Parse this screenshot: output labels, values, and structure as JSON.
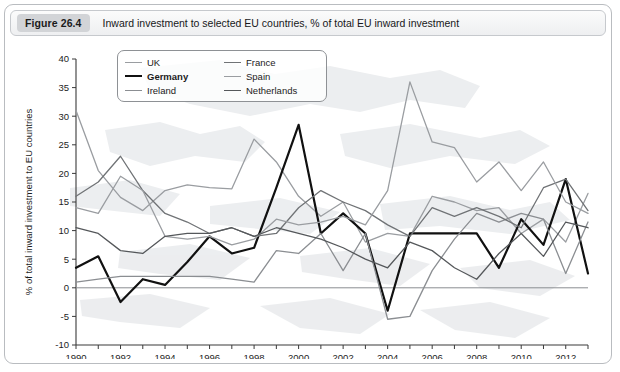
{
  "figure": {
    "badge": "Figure 26.4",
    "caption": "Inward investment to selected EU countries, % of total EU inward investment"
  },
  "chart_data": {
    "type": "line",
    "title": "Inward investment to selected EU countries, % of total EU inward investment",
    "xlabel": "",
    "ylabel": "% of total inward investment to EU countries",
    "xlim": [
      1990,
      2013
    ],
    "ylim": [
      -10,
      40
    ],
    "yticks": [
      -10,
      -5,
      0,
      5,
      10,
      15,
      20,
      25,
      30,
      35,
      40
    ],
    "ytick_labels": [
      "-10",
      "-5",
      "0",
      "5",
      "10",
      "15",
      "20",
      "25",
      "30",
      "35",
      "40"
    ],
    "xticks": [
      1990,
      1992,
      1994,
      1996,
      1998,
      2000,
      2002,
      2004,
      2006,
      2008,
      2010,
      2012
    ],
    "xtick_labels": [
      "1990",
      "1992",
      "1994",
      "1996",
      "1998",
      "2000",
      "2002",
      "2004",
      "2006",
      "2008",
      "2010",
      "2012"
    ],
    "x": [
      1990,
      1991,
      1992,
      1993,
      1994,
      1995,
      1996,
      1997,
      1998,
      1999,
      2000,
      2001,
      2002,
      2003,
      2004,
      2005,
      2006,
      2007,
      2008,
      2009,
      2010,
      2011,
      2012,
      2013
    ],
    "grid": false,
    "zero_line": true,
    "legend_position": "top-center",
    "series": [
      {
        "name": "UK",
        "color": "#9a9da1",
        "width": 1.3,
        "values": [
          31.0,
          20.5,
          15.8,
          13.5,
          17.0,
          18.0,
          17.5,
          17.3,
          26.0,
          22.0,
          16.0,
          12.5,
          15.0,
          8.0,
          9.5,
          9.0,
          16.0,
          15.0,
          13.5,
          14.0,
          9.5,
          12.0,
          8.0,
          16.5
        ]
      },
      {
        "name": "Germany",
        "color": "#111111",
        "width": 2.2,
        "values": [
          3.5,
          5.5,
          -2.5,
          1.5,
          0.5,
          4.5,
          9.0,
          6.0,
          7.0,
          17.5,
          28.5,
          9.5,
          13.0,
          9.5,
          -4.0,
          9.5,
          9.5,
          9.5,
          9.5,
          3.5,
          12.0,
          7.5,
          19.0,
          2.5
        ]
      },
      {
        "name": "Ireland",
        "color": "#8b8e92",
        "width": 1.3,
        "values": [
          1.0,
          1.5,
          2.0,
          2.0,
          2.0,
          2.0,
          2.0,
          1.5,
          1.0,
          6.5,
          6.0,
          9.5,
          3.0,
          9.5,
          -5.5,
          -5.0,
          3.0,
          8.5,
          13.0,
          11.5,
          13.0,
          12.0,
          2.5,
          11.5
        ]
      },
      {
        "name": "France",
        "color": "#707376",
        "width": 1.3,
        "values": [
          16.0,
          18.5,
          23.0,
          17.0,
          13.0,
          11.5,
          9.5,
          10.5,
          9.0,
          9.5,
          14.0,
          17.0,
          15.0,
          13.5,
          11.0,
          9.0,
          14.0,
          12.5,
          14.0,
          12.5,
          10.5,
          17.5,
          19.0,
          13.5
        ]
      },
      {
        "name": "Spain",
        "color": "#9a9da1",
        "width": 1.3,
        "values": [
          14.0,
          13.0,
          19.5,
          17.0,
          9.0,
          8.5,
          9.0,
          7.5,
          8.5,
          12.0,
          11.0,
          11.5,
          12.5,
          11.0,
          17.0,
          36.0,
          25.5,
          24.5,
          18.5,
          22.0,
          17.0,
          22.0,
          15.0,
          13.0
        ]
      },
      {
        "name": "Netherlands",
        "color": "#55585b",
        "width": 1.3,
        "values": [
          10.5,
          9.5,
          6.5,
          6.0,
          9.0,
          9.5,
          9.5,
          10.5,
          9.0,
          10.5,
          9.5,
          8.5,
          7.0,
          5.0,
          3.5,
          8.0,
          6.5,
          3.5,
          1.5,
          6.0,
          9.5,
          5.5,
          11.5,
          10.5
        ]
      }
    ]
  },
  "legend": {
    "items": [
      {
        "label": "UK",
        "color": "#9a9da1",
        "bold": false
      },
      {
        "label": "France",
        "color": "#707376",
        "bold": false
      },
      {
        "label": "Germany",
        "color": "#111111",
        "bold": true
      },
      {
        "label": "Spain",
        "color": "#9a9da1",
        "bold": false
      },
      {
        "label": "Ireland",
        "color": "#8b8e92",
        "bold": false
      },
      {
        "label": "Netherlands",
        "color": "#55585b",
        "bold": false
      }
    ]
  }
}
